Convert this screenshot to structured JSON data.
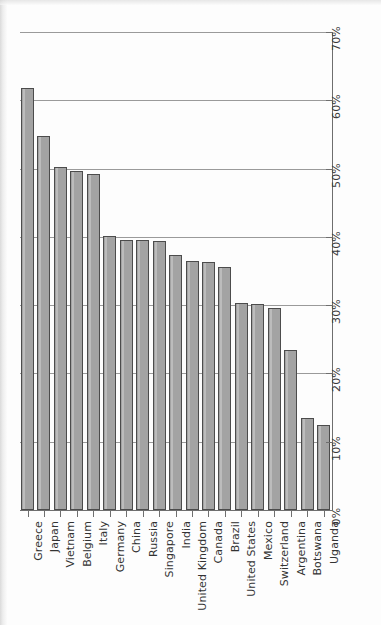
{
  "chart_data": {
    "type": "bar",
    "title": "",
    "subtitle": "",
    "xlabel": "",
    "ylabel": "",
    "ylim": [
      0,
      70
    ],
    "grid": true,
    "legend": null,
    "orientation": "vertical",
    "value_suffix": "%",
    "y_ticks": [
      "0%",
      "10%",
      "20%",
      "30%",
      "40%",
      "50%",
      "60%",
      "70%"
    ],
    "y_tick_values": [
      0,
      10,
      20,
      30,
      40,
      50,
      60,
      70
    ],
    "categories": [
      "Greece",
      "Japan",
      "Vietnam",
      "Belgium",
      "Italy",
      "Germany",
      "China",
      "Russia",
      "Singapore",
      "India",
      "United Kingdom",
      "Canada",
      "Brazil",
      "United States",
      "Mexico",
      "Switzerland",
      "Argentina",
      "Botswana",
      "Uganda"
    ],
    "values": [
      61.8,
      54.8,
      50.2,
      49.6,
      49.2,
      40.2,
      39.6,
      39.6,
      39.4,
      37.4,
      36.4,
      36.3,
      35.6,
      30.3,
      30.2,
      29.6,
      23.4,
      13.5,
      12.4
    ],
    "bar_color": "#a3a3a3",
    "bar_edge_color": "#4c4c4c",
    "grid_color": "#9a9a9a",
    "axis_color": "#6e6e6e"
  }
}
